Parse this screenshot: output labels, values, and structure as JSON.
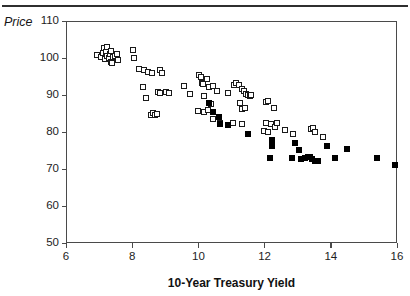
{
  "chart_data": {
    "type": "scatter",
    "title": "",
    "xlabel": "10-Year Treasury Yield",
    "ylabel": "Price",
    "xlim": [
      6,
      16
    ],
    "ylim": [
      50,
      110
    ],
    "xticks": [
      6,
      8,
      10,
      12,
      14,
      16
    ],
    "yticks": [
      110,
      100,
      90,
      80,
      70,
      60,
      50
    ],
    "grid": false,
    "legend": "none",
    "series": [
      {
        "name": "open-square",
        "marker": "open square",
        "points": [
          [
            6.92,
            101.0
          ],
          [
            7.02,
            100.6
          ],
          [
            7.1,
            101.6
          ],
          [
            7.12,
            102.9
          ],
          [
            7.14,
            100.1
          ],
          [
            7.18,
            101.9
          ],
          [
            7.2,
            100.8
          ],
          [
            7.22,
            103.3
          ],
          [
            7.26,
            100.2
          ],
          [
            7.3,
            101.3
          ],
          [
            7.32,
            102.2
          ],
          [
            7.34,
            99.2
          ],
          [
            7.36,
            99.0
          ],
          [
            7.4,
            100.6
          ],
          [
            7.44,
            100.9
          ],
          [
            7.5,
            101.4
          ],
          [
            7.54,
            99.6
          ],
          [
            8.0,
            102.5
          ],
          [
            8.02,
            100.3
          ],
          [
            8.18,
            97.2
          ],
          [
            8.34,
            96.9
          ],
          [
            8.46,
            96.6
          ],
          [
            8.56,
            96.2
          ],
          [
            8.82,
            97.0
          ],
          [
            8.86,
            96.3
          ],
          [
            8.3,
            92.5
          ],
          [
            8.4,
            89.5
          ],
          [
            8.74,
            91.2
          ],
          [
            8.82,
            90.8
          ],
          [
            8.98,
            91.0
          ],
          [
            9.08,
            90.7
          ],
          [
            8.54,
            84.9
          ],
          [
            8.6,
            85.4
          ],
          [
            8.66,
            84.8
          ],
          [
            8.72,
            85.2
          ],
          [
            9.54,
            92.6
          ],
          [
            9.72,
            90.6
          ],
          [
            10.0,
            95.8
          ],
          [
            10.06,
            95.2
          ],
          [
            10.08,
            93.4
          ],
          [
            10.1,
            93.2
          ],
          [
            10.22,
            94.5
          ],
          [
            10.28,
            92.5
          ],
          [
            10.42,
            92.6
          ],
          [
            10.52,
            91.4
          ],
          [
            10.14,
            89.9
          ],
          [
            10.34,
            87.8
          ],
          [
            9.96,
            86.0
          ],
          [
            10.14,
            85.7
          ],
          [
            10.26,
            86.2
          ],
          [
            10.42,
            83.9
          ],
          [
            10.62,
            82.8
          ],
          [
            10.86,
            90.8
          ],
          [
            11.06,
            92.9
          ],
          [
            11.12,
            93.4
          ],
          [
            11.2,
            93.0
          ],
          [
            11.3,
            92.0
          ],
          [
            11.36,
            91.3
          ],
          [
            11.4,
            90.6
          ],
          [
            11.46,
            90.4
          ],
          [
            11.52,
            89.9
          ],
          [
            11.56,
            90.2
          ],
          [
            11.22,
            88.0
          ],
          [
            11.3,
            86.5
          ],
          [
            11.38,
            86.7
          ],
          [
            11.0,
            82.6
          ],
          [
            11.3,
            82.4
          ],
          [
            12.0,
            88.3
          ],
          [
            12.06,
            88.6
          ],
          [
            12.26,
            86.8
          ],
          [
            12.02,
            82.8
          ],
          [
            12.16,
            82.3
          ],
          [
            12.28,
            81.6
          ],
          [
            12.34,
            82.6
          ],
          [
            11.96,
            80.5
          ],
          [
            12.08,
            80.4
          ],
          [
            12.58,
            80.8
          ],
          [
            12.82,
            79.6
          ],
          [
            13.36,
            81.0
          ],
          [
            13.42,
            81.4
          ],
          [
            13.48,
            80.2
          ],
          [
            13.72,
            79.0
          ]
        ]
      },
      {
        "name": "filled-square",
        "marker": "filled square",
        "points": [
          [
            10.3,
            88.2
          ],
          [
            10.4,
            85.6
          ],
          [
            10.58,
            84.2
          ],
          [
            10.62,
            82.3
          ],
          [
            10.86,
            82.1
          ],
          [
            11.48,
            79.6
          ],
          [
            12.2,
            78.0
          ],
          [
            12.18,
            76.4
          ],
          [
            12.14,
            73.3
          ],
          [
            12.88,
            77.2
          ],
          [
            13.02,
            75.4
          ],
          [
            12.8,
            73.2
          ],
          [
            13.06,
            73.0
          ],
          [
            13.18,
            73.2
          ],
          [
            13.28,
            73.4
          ],
          [
            13.34,
            73.6
          ],
          [
            13.4,
            73.0
          ],
          [
            13.5,
            72.5
          ],
          [
            13.58,
            72.3
          ],
          [
            13.86,
            76.6
          ],
          [
            14.1,
            73.2
          ],
          [
            14.46,
            75.8
          ],
          [
            15.38,
            73.2
          ],
          [
            15.92,
            71.4
          ]
        ]
      }
    ]
  },
  "axes": {
    "y_tick_labels": [
      "110",
      "100",
      "90",
      "80",
      "70",
      "60",
      "50"
    ],
    "x_tick_labels": [
      "6",
      "8",
      "10",
      "12",
      "14",
      "16"
    ],
    "y_axis_title": "Price",
    "x_axis_title": "10-Year Treasury Yield"
  }
}
